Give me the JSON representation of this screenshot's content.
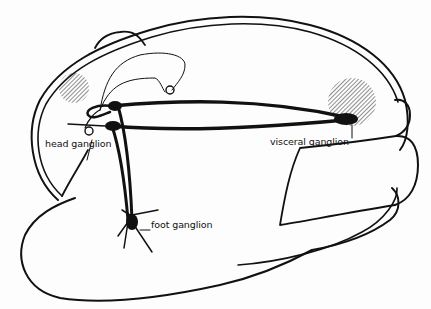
{
  "diagram": {
    "labels": {
      "head": "head ganglion",
      "visceral": "visceral ganglion",
      "foot": "foot ganglion"
    },
    "colors": {
      "ink": "#111111",
      "background": "#fdfdfd"
    }
  }
}
